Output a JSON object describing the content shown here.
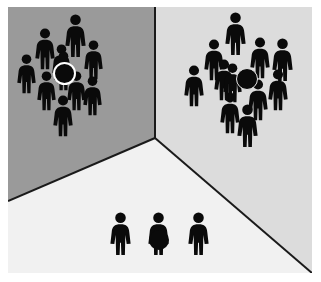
{
  "scene": {
    "title": "Three-panel room with crowds of pictogram figures",
    "outer_background": "#ffffff",
    "margin_left": 8,
    "margin_top": 7,
    "width": 304,
    "height": 266,
    "corner_vertex": {
      "x": 147,
      "y": 131
    },
    "planes": [
      {
        "name": "left-wall",
        "label": "Left wall",
        "color": "#9a9a9a"
      },
      {
        "name": "right-wall",
        "label": "Right wall",
        "color": "#dcdcdc"
      },
      {
        "name": "floor",
        "label": "Floor",
        "color": "#f1f1f1"
      }
    ],
    "edge_color": "#1a1a1a",
    "figure_color": "#0a0a0a",
    "marker_colors": {
      "fill": "#0a0a0a",
      "highlight_ring": "#ffffff",
      "soft_ring": "#e6e6e6"
    }
  },
  "groups": [
    {
      "name": "left-crowd",
      "label": "Left wall crowd",
      "count": 10,
      "highlighted_index": 9,
      "figures": [
        {
          "x": 56,
          "y": 7,
          "h": 44
        },
        {
          "x": 26,
          "y": 21,
          "h": 42
        },
        {
          "x": 75,
          "y": 33,
          "h": 40
        },
        {
          "x": 43,
          "y": 37,
          "h": 40
        },
        {
          "x": 8,
          "y": 47,
          "h": 40
        },
        {
          "x": 28,
          "y": 64,
          "h": 40
        },
        {
          "x": 58,
          "y": 64,
          "h": 40
        },
        {
          "x": 74,
          "y": 69,
          "h": 40
        },
        {
          "x": 44,
          "y": 88,
          "h": 42
        },
        {
          "x": 45,
          "y": 44,
          "h": 40
        }
      ],
      "marker": {
        "x": 45,
        "y": 55,
        "d": 19,
        "style": "ringed"
      }
    },
    {
      "name": "right-crowd",
      "label": "Right wall crowd",
      "count": 11,
      "highlighted_index": 10,
      "figures": [
        {
          "x": 216,
          "y": 5,
          "h": 44
        },
        {
          "x": 195,
          "y": 32,
          "h": 42
        },
        {
          "x": 241,
          "y": 30,
          "h": 42
        },
        {
          "x": 263,
          "y": 31,
          "h": 44
        },
        {
          "x": 175,
          "y": 58,
          "h": 42
        },
        {
          "x": 259,
          "y": 62,
          "h": 42
        },
        {
          "x": 239,
          "y": 72,
          "h": 42
        },
        {
          "x": 211,
          "y": 85,
          "h": 42
        },
        {
          "x": 228,
          "y": 97,
          "h": 44
        },
        {
          "x": 205,
          "y": 52,
          "h": 42
        },
        {
          "x": 214,
          "y": 56,
          "h": 40
        }
      ],
      "marker": {
        "x": 228,
        "y": 61,
        "d": 20,
        "style": "softring"
      }
    },
    {
      "name": "floor-trio",
      "label": "Floor group",
      "count": 3,
      "highlighted_index": 1,
      "figures": [
        {
          "x": 101,
          "y": 205,
          "h": 44
        },
        {
          "x": 139,
          "y": 205,
          "h": 44
        },
        {
          "x": 179,
          "y": 205,
          "h": 44
        }
      ],
      "marker": {
        "x": 141,
        "y": 223,
        "d": 20,
        "style": "plain"
      }
    }
  ],
  "alt_text": "A three-dimensional room corner rendered in flat gray tones. Two dense crowds of black human pictograms stand on the left and right walls, each containing one figure marked with a large dark circle. Three isolated figures stand on the light floor, the middle one also marked with a dark circle."
}
